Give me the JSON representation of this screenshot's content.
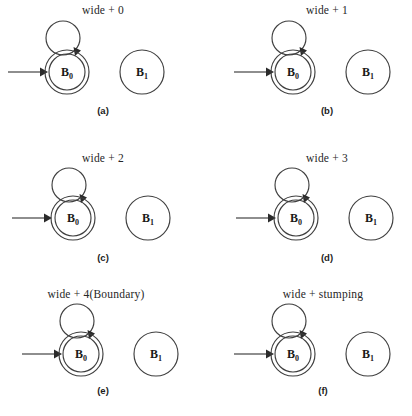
{
  "figure": {
    "background_color": "#ffffff",
    "stroke_color": "#3f3f3f",
    "text_color": "#1a1a1a",
    "columns": 2,
    "rows": 3
  },
  "states": {
    "accepting_state_label_base": "B",
    "accepting_state_label_sub": "0",
    "normal_state_label_base": "B",
    "normal_state_label_sub": "1"
  },
  "panels": [
    {
      "id": "a",
      "transition_label": "wide + 0",
      "caption": "(a)",
      "start_state": "B0",
      "accepting_state": "B0",
      "other_state": "B1",
      "self_loop": true
    },
    {
      "id": "b",
      "transition_label": "wide + 1",
      "caption": "(b)",
      "start_state": "B0",
      "accepting_state": "B0",
      "other_state": "B1",
      "self_loop": true
    },
    {
      "id": "c",
      "transition_label": "wide + 2",
      "caption": "(c)",
      "start_state": "B0",
      "accepting_state": "B0",
      "other_state": "B1",
      "self_loop": true
    },
    {
      "id": "d",
      "transition_label": "wide + 3",
      "caption": "(d)",
      "start_state": "B0",
      "accepting_state": "B0",
      "other_state": "B1",
      "self_loop": true
    },
    {
      "id": "e",
      "transition_label": "wide + 4(Boundary)",
      "caption": "(e)",
      "start_state": "B0",
      "accepting_state": "B0",
      "other_state": "B1",
      "self_loop": true
    },
    {
      "id": "f",
      "transition_label": "wide + stumping",
      "caption": "(f)",
      "start_state": "B0",
      "accepting_state": "B0",
      "other_state": "B1",
      "self_loop": true
    }
  ]
}
